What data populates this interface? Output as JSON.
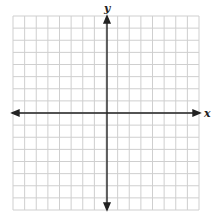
{
  "diagram": {
    "type": "coordinate-plane",
    "x_axis_label": "x",
    "y_axis_label": "y",
    "grid": {
      "columns": 16,
      "rows": 16,
      "x_range": [
        -8,
        8
      ],
      "y_range": [
        -8,
        8
      ]
    },
    "colors": {
      "grid": "#cfcfcf",
      "axis": "#222222",
      "background": "#ffffff"
    }
  }
}
